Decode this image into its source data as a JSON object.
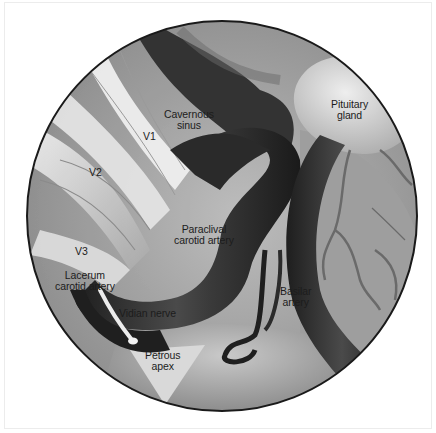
{
  "figure": {
    "view": "circular endoscopic view",
    "palette": {
      "background": "#ffffff",
      "rim": "#1a1a1a",
      "artery_dark": "#2b2b2b",
      "tissue_light": "#d8d8d8",
      "tissue_mid": "#9a9a9a"
    }
  },
  "labels": {
    "cavernous_sinus": [
      "Cavernous",
      "sinus"
    ],
    "pituitary_gland": [
      "Pituitary",
      "gland"
    ],
    "v1": "V1",
    "v2": "V2",
    "v3": "V3",
    "paraclival_carotid_artery": [
      "Paraclival",
      "carotid artery"
    ],
    "lacerum_carotid_artery": [
      "Lacerum",
      "carotid artery"
    ],
    "vidian_nerve": "Vidian nerve",
    "basilar_artery": [
      "Basilar",
      "artery"
    ],
    "petrous_apex": [
      "Petrous",
      "apex"
    ]
  }
}
